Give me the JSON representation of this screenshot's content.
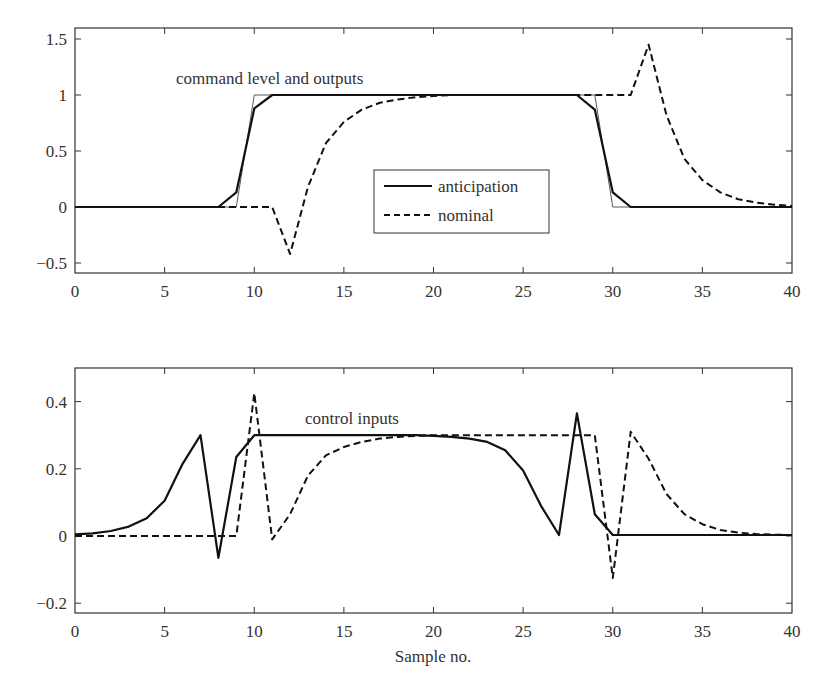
{
  "chart_data": [
    {
      "type": "line",
      "title": "",
      "annotation": "command level and outputs",
      "xlabel": "",
      "ylabel": "",
      "xlim": [
        0,
        40
      ],
      "ylim": [
        -0.6,
        1.6
      ],
      "xticks": [
        "0",
        "5",
        "10",
        "15",
        "20",
        "25",
        "30",
        "35",
        "40"
      ],
      "yticks": [
        "1.5",
        "1",
        "0.5",
        "0",
        "−0.5"
      ],
      "ytick_values": [
        1.5,
        1,
        0.5,
        0,
        -0.5
      ],
      "grid": false,
      "legend": {
        "position": "center",
        "entries": [
          "anticipation",
          "nominal"
        ]
      },
      "x": [
        0,
        1,
        2,
        3,
        4,
        5,
        6,
        7,
        8,
        9,
        10,
        11,
        12,
        13,
        14,
        15,
        16,
        17,
        18,
        19,
        20,
        21,
        22,
        23,
        24,
        25,
        26,
        27,
        28,
        29,
        30,
        31,
        32,
        33,
        34,
        35,
        36,
        37,
        38,
        39,
        40
      ],
      "series": [
        {
          "name": "command",
          "style": "thin",
          "x": [
            0,
            9,
            10,
            29,
            30,
            40
          ],
          "values": [
            0,
            0,
            1,
            1,
            0,
            0
          ]
        },
        {
          "name": "anticipation",
          "style": "solid",
          "values": [
            0,
            0,
            0,
            0,
            0,
            0,
            0,
            0,
            0,
            0.13,
            0.88,
            1,
            1,
            1,
            1,
            1,
            1,
            1,
            1,
            1,
            1,
            1,
            1,
            1,
            1,
            1,
            1,
            1,
            1,
            0.87,
            0.13,
            0,
            0,
            0,
            0,
            0,
            0,
            0,
            0,
            0,
            0
          ]
        },
        {
          "name": "nominal",
          "style": "dashed",
          "values": [
            0,
            0,
            0,
            0,
            0,
            0,
            0,
            0,
            0,
            0,
            0,
            0,
            -0.42,
            0.18,
            0.57,
            0.76,
            0.87,
            0.93,
            0.96,
            0.98,
            0.99,
            1,
            1,
            1,
            1,
            1,
            1,
            1,
            1,
            1,
            1,
            1,
            1.45,
            0.82,
            0.43,
            0.24,
            0.13,
            0.07,
            0.04,
            0.02,
            0.01
          ]
        }
      ]
    },
    {
      "type": "line",
      "title": "",
      "annotation": "control inputs",
      "xlabel": "Sample no.",
      "ylabel": "",
      "xlim": [
        0,
        40
      ],
      "ylim": [
        -0.23,
        0.5
      ],
      "xticks": [
        "0",
        "5",
        "10",
        "15",
        "20",
        "25",
        "30",
        "35",
        "40"
      ],
      "yticks": [
        "0.4",
        "0.2",
        "0",
        "−0.2"
      ],
      "ytick_values": [
        0.4,
        0.2,
        0,
        -0.2
      ],
      "grid": false,
      "x": [
        0,
        1,
        2,
        3,
        4,
        5,
        6,
        7,
        8,
        9,
        10,
        11,
        12,
        13,
        14,
        15,
        16,
        17,
        18,
        19,
        20,
        21,
        22,
        23,
        24,
        25,
        26,
        27,
        28,
        29,
        30,
        31,
        32,
        33,
        34,
        35,
        36,
        37,
        38,
        39,
        40
      ],
      "series": [
        {
          "name": "anticipation",
          "style": "solid",
          "values": [
            0.005,
            0.008,
            0.015,
            0.028,
            0.053,
            0.105,
            0.215,
            0.3,
            -0.065,
            0.235,
            0.3,
            0.3,
            0.3,
            0.3,
            0.3,
            0.3,
            0.3,
            0.3,
            0.3,
            0.3,
            0.298,
            0.295,
            0.29,
            0.28,
            0.255,
            0.195,
            0.09,
            0.003,
            0.365,
            0.065,
            0.003,
            0.003,
            0.003,
            0.003,
            0.003,
            0.003,
            0.003,
            0.003,
            0.003,
            0.003,
            0.003
          ]
        },
        {
          "name": "nominal",
          "style": "dashed",
          "values": [
            0,
            0,
            0,
            0,
            0,
            0,
            0,
            0,
            0,
            0,
            0.425,
            -0.01,
            0.065,
            0.18,
            0.24,
            0.265,
            0.28,
            0.29,
            0.295,
            0.298,
            0.3,
            0.3,
            0.3,
            0.3,
            0.3,
            0.3,
            0.3,
            0.3,
            0.3,
            0.3,
            -0.125,
            0.31,
            0.23,
            0.125,
            0.065,
            0.035,
            0.018,
            0.01,
            0.006,
            0.004,
            0.003
          ]
        }
      ]
    }
  ]
}
